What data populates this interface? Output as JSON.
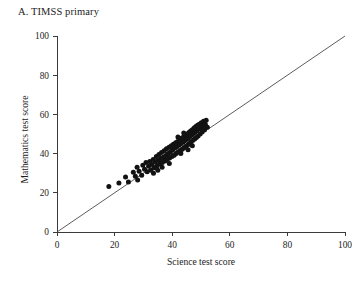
{
  "chart_data": {
    "type": "scatter",
    "title": "A. TIMSS primary",
    "xlabel": "Science test score",
    "ylabel": "Mathematics test score",
    "xlim": [
      0,
      100
    ],
    "ylim": [
      0,
      100
    ],
    "xticks": [
      0,
      20,
      40,
      60,
      80,
      100
    ],
    "yticks": [
      0,
      20,
      40,
      60,
      80,
      100
    ],
    "grid": false,
    "legend": null,
    "annotations": [],
    "reference_line": {
      "name": "identity-line",
      "description": "45-degree y = x reference line",
      "from": [
        0,
        0
      ],
      "to": [
        100,
        100
      ]
    },
    "series": [
      {
        "name": "Countries",
        "marker": "filled-circle",
        "color": "#121212",
        "points": [
          [
            18.0,
            23.2
          ],
          [
            21.5,
            25.0
          ],
          [
            23.8,
            28.0
          ],
          [
            24.8,
            25.5
          ],
          [
            26.5,
            30.5
          ],
          [
            27.2,
            28.5
          ],
          [
            27.8,
            33.0
          ],
          [
            28.5,
            31.0
          ],
          [
            29.4,
            29.0
          ],
          [
            29.8,
            34.0
          ],
          [
            30.4,
            32.0
          ],
          [
            30.9,
            35.5
          ],
          [
            31.3,
            30.8
          ],
          [
            31.8,
            33.5
          ],
          [
            32.2,
            36.0
          ],
          [
            32.6,
            31.5
          ],
          [
            33.0,
            34.5
          ],
          [
            33.4,
            37.0
          ],
          [
            33.8,
            32.8
          ],
          [
            34.1,
            35.8
          ],
          [
            34.5,
            38.5
          ],
          [
            34.8,
            33.8
          ],
          [
            35.1,
            36.5
          ],
          [
            35.4,
            39.5
          ],
          [
            35.7,
            34.8
          ],
          [
            36.0,
            37.5
          ],
          [
            36.3,
            40.5
          ],
          [
            36.6,
            35.5
          ],
          [
            36.9,
            38.2
          ],
          [
            37.2,
            41.5
          ],
          [
            37.5,
            36.2
          ],
          [
            37.8,
            39.0
          ],
          [
            38.0,
            42.5
          ],
          [
            38.3,
            37.0
          ],
          [
            38.6,
            40.0
          ],
          [
            38.9,
            43.2
          ],
          [
            39.1,
            37.8
          ],
          [
            39.4,
            41.0
          ],
          [
            39.7,
            44.0
          ],
          [
            39.9,
            38.5
          ],
          [
            40.2,
            42.0
          ],
          [
            40.4,
            44.8
          ],
          [
            40.7,
            39.2
          ],
          [
            40.9,
            42.8
          ],
          [
            41.2,
            45.5
          ],
          [
            41.4,
            40.0
          ],
          [
            41.6,
            43.5
          ],
          [
            41.9,
            46.2
          ],
          [
            42.1,
            40.8
          ],
          [
            42.3,
            44.2
          ],
          [
            42.6,
            47.0
          ],
          [
            42.8,
            41.5
          ],
          [
            43.0,
            45.0
          ],
          [
            43.2,
            47.8
          ],
          [
            43.5,
            42.2
          ],
          [
            43.7,
            45.8
          ],
          [
            43.9,
            48.5
          ],
          [
            44.1,
            43.0
          ],
          [
            44.3,
            46.5
          ],
          [
            44.5,
            49.2
          ],
          [
            44.8,
            43.8
          ],
          [
            45.0,
            47.2
          ],
          [
            45.2,
            50.0
          ],
          [
            45.4,
            44.5
          ],
          [
            45.6,
            48.0
          ],
          [
            45.8,
            50.8
          ],
          [
            46.0,
            45.2
          ],
          [
            46.2,
            48.8
          ],
          [
            46.4,
            51.5
          ],
          [
            46.6,
            46.0
          ],
          [
            46.8,
            49.5
          ],
          [
            47.0,
            52.2
          ],
          [
            47.2,
            46.8
          ],
          [
            47.4,
            50.2
          ],
          [
            47.6,
            53.0
          ],
          [
            47.8,
            47.5
          ],
          [
            48.0,
            51.0
          ],
          [
            48.2,
            53.8
          ],
          [
            48.4,
            48.2
          ],
          [
            48.6,
            51.8
          ],
          [
            48.8,
            54.5
          ],
          [
            49.0,
            49.0
          ],
          [
            49.2,
            52.5
          ],
          [
            49.4,
            55.0
          ],
          [
            49.7,
            50.0
          ],
          [
            49.9,
            53.2
          ],
          [
            50.1,
            55.8
          ],
          [
            50.4,
            51.0
          ],
          [
            50.6,
            54.0
          ],
          [
            50.9,
            56.5
          ],
          [
            51.2,
            52.0
          ],
          [
            51.5,
            55.0
          ],
          [
            51.8,
            57.0
          ],
          [
            52.2,
            53.5
          ],
          [
            42.0,
            48.5
          ],
          [
            44.0,
            50.5
          ],
          [
            35.0,
            31.5
          ],
          [
            28.0,
            26.5
          ],
          [
            39.0,
            35.0
          ],
          [
            45.5,
            42.0
          ],
          [
            33.5,
            30.0
          ],
          [
            36.5,
            33.0
          ],
          [
            43.0,
            40.0
          ],
          [
            47.0,
            44.0
          ]
        ]
      }
    ]
  }
}
